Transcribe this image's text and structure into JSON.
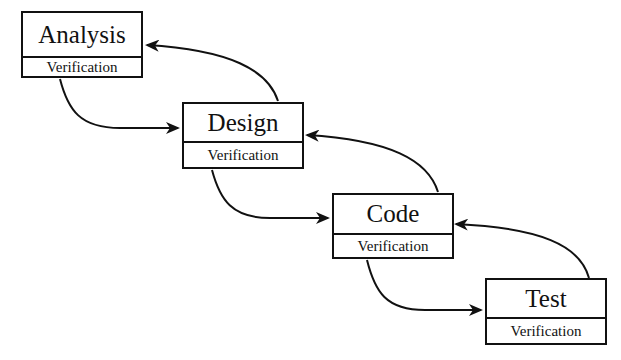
{
  "diagram": {
    "type": "waterfall-process",
    "stages": [
      {
        "title": "Analysis",
        "sub": "Verification"
      },
      {
        "title": "Design",
        "sub": "Verification"
      },
      {
        "title": "Code",
        "sub": "Verification"
      },
      {
        "title": "Test",
        "sub": "Verification"
      }
    ],
    "edges": [
      {
        "from": "Analysis",
        "to": "Design",
        "kind": "forward"
      },
      {
        "from": "Design",
        "to": "Analysis",
        "kind": "feedback"
      },
      {
        "from": "Design",
        "to": "Code",
        "kind": "forward"
      },
      {
        "from": "Code",
        "to": "Design",
        "kind": "feedback"
      },
      {
        "from": "Code",
        "to": "Test",
        "kind": "forward"
      },
      {
        "from": "Test",
        "to": "Code",
        "kind": "feedback"
      }
    ]
  }
}
